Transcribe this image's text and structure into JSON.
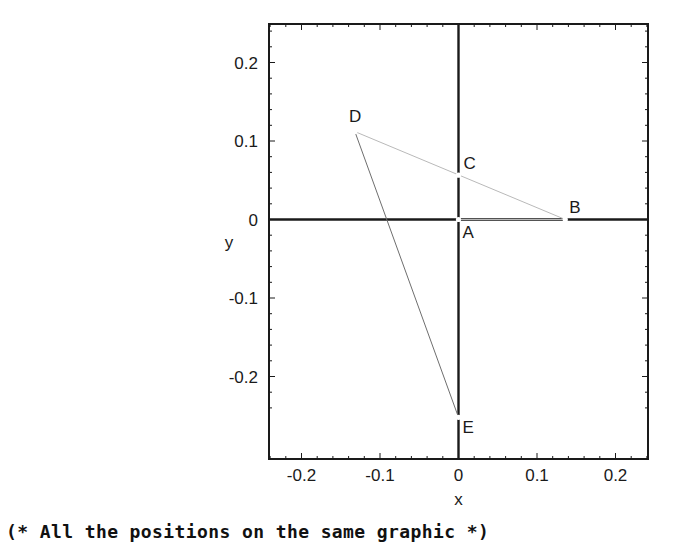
{
  "caption": "(* All the positions on the same graphic *)",
  "figure": {
    "frame": {
      "left": 269,
      "top": 24,
      "right": 648,
      "bottom": 459
    },
    "origin_px": {
      "x": 458.5,
      "y": 219.5
    },
    "scale_px_per_unit": 785
  },
  "chart_data": {
    "type": "scatter",
    "title": "",
    "xlabel": "x",
    "ylabel": "y",
    "xlim": [
      -0.2414,
      0.2414
    ],
    "ylim": [
      -0.249,
      0.3057
    ],
    "grid": false,
    "legend": "none",
    "xticks": [
      -0.2,
      -0.1,
      0,
      0.1,
      0.2
    ],
    "xtick_labels": [
      "-0.2",
      "-0.1",
      "0",
      "0.1",
      "0.2"
    ],
    "yticks": [
      -0.2,
      -0.1,
      0,
      0.1,
      0.2
    ],
    "ytick_labels": [
      "-0.2",
      "-0.1",
      "0",
      "0.1",
      "0.2"
    ],
    "minor_tick_step": 0.02,
    "points": [
      {
        "name": "A",
        "x": 0.0,
        "y": 0.0,
        "label_dx": 4,
        "label_dy": 18
      },
      {
        "name": "B",
        "x": 0.136,
        "y": 0.0,
        "label_dx": 4,
        "label_dy": -7
      },
      {
        "name": "C",
        "x": 0.0,
        "y": 0.0565,
        "label_dx": 5,
        "label_dy": -6
      },
      {
        "name": "D",
        "x": -0.132,
        "y": 0.112,
        "label_dx": -6,
        "label_dy": -10
      },
      {
        "name": "E",
        "x": 0.0,
        "y": -0.252,
        "label_dx": 4,
        "label_dy": 16
      }
    ],
    "segments": [
      {
        "from": "D",
        "to": "B",
        "color": "#b9b9b9",
        "width": 1.0
      },
      {
        "from": "A",
        "to": "B",
        "color": "#b9b9b9",
        "width": 1.0
      },
      {
        "from": "D",
        "to": "E",
        "color": "#6e6e6e",
        "width": 1.0
      }
    ],
    "axis_color": "#1a1a1a",
    "frame_color": "#1a1a1a",
    "point_color": "#ffffff"
  }
}
